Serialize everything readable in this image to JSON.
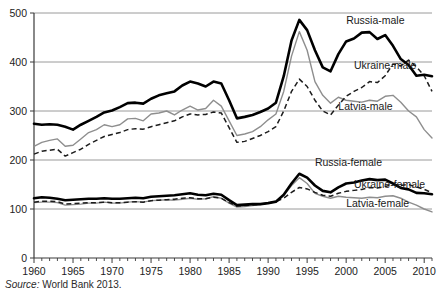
{
  "chart_data": {
    "type": "line",
    "title": "",
    "subtitle": "",
    "xlabel": "",
    "ylabel": "",
    "xlim": [
      1960,
      2011
    ],
    "ylim": [
      0,
      500
    ],
    "yticks": [
      0,
      100,
      200,
      300,
      400,
      500
    ],
    "ytick_labels": [
      "0",
      "100",
      "200",
      "300",
      "400",
      "500"
    ],
    "xticks": [
      1960,
      1965,
      1970,
      1975,
      1980,
      1985,
      1990,
      1995,
      2000,
      2005,
      2010
    ],
    "xtick_labels": [
      "1960",
      "1965",
      "1970",
      "1975",
      "1980",
      "1985",
      "1990",
      "1995",
      "2000",
      "2005",
      "2010"
    ],
    "minor_xtick_interval": 1,
    "grid": "horizontal",
    "legend_position": "inline-annotations",
    "x": [
      1960,
      1961,
      1962,
      1963,
      1964,
      1965,
      1966,
      1967,
      1968,
      1969,
      1970,
      1971,
      1972,
      1973,
      1974,
      1975,
      1976,
      1977,
      1978,
      1979,
      1980,
      1981,
      1982,
      1983,
      1984,
      1985,
      1986,
      1987,
      1988,
      1989,
      1990,
      1991,
      1992,
      1993,
      1994,
      1995,
      1996,
      1997,
      1998,
      1999,
      2000,
      2001,
      2002,
      2003,
      2004,
      2005,
      2006,
      2007,
      2008,
      2009,
      2010,
      2011
    ],
    "series": [
      {
        "name": "Russia-male",
        "style": "thick-solid-black",
        "color": "#000000",
        "label": "Russia-male",
        "values": [
          274,
          272,
          273,
          272,
          268,
          262,
          272,
          280,
          288,
          297,
          301,
          308,
          316,
          317,
          315,
          325,
          332,
          336,
          340,
          352,
          360,
          356,
          350,
          360,
          356,
          322,
          285,
          288,
          292,
          298,
          305,
          317,
          371,
          444,
          486,
          465,
          424,
          389,
          381,
          416,
          442,
          448,
          460,
          461,
          447,
          455,
          433,
          406,
          394,
          372,
          374,
          371
        ]
      },
      {
        "name": "Ukraine-male",
        "style": "dashed-black",
        "color": "#1c1c1c",
        "label": "Ukraine-male",
        "values": [
          212,
          218,
          220,
          222,
          208,
          215,
          222,
          232,
          240,
          248,
          252,
          256,
          262,
          264,
          263,
          268,
          272,
          276,
          280,
          288,
          294,
          292,
          293,
          298,
          296,
          266,
          236,
          238,
          244,
          250,
          258,
          268,
          300,
          340,
          365,
          350,
          322,
          300,
          292,
          312,
          330,
          340,
          348,
          360,
          358,
          372,
          396,
          392,
          404,
          390,
          372,
          340
        ]
      },
      {
        "name": "Latvia-male",
        "style": "thin-solid-gray",
        "color": "#8e8e8e",
        "label": "Latvia-male",
        "values": [
          228,
          236,
          240,
          243,
          228,
          230,
          243,
          256,
          262,
          272,
          268,
          272,
          284,
          285,
          280,
          294,
          296,
          300,
          292,
          302,
          310,
          302,
          305,
          322,
          310,
          280,
          250,
          253,
          258,
          268,
          282,
          294,
          340,
          412,
          462,
          424,
          360,
          332,
          316,
          328,
          322,
          320,
          318,
          322,
          320,
          330,
          332,
          318,
          300,
          288,
          262,
          245
        ]
      },
      {
        "name": "Russia-female",
        "style": "thick-solid-black",
        "color": "#000000",
        "label": "Russia-female",
        "values": [
          122,
          124,
          123,
          121,
          118,
          119,
          120,
          121,
          121,
          122,
          121,
          121,
          122,
          123,
          122,
          125,
          126,
          127,
          128,
          130,
          132,
          129,
          128,
          131,
          129,
          118,
          108,
          109,
          110,
          110,
          112,
          115,
          129,
          152,
          172,
          164,
          148,
          137,
          134,
          144,
          152,
          154,
          158,
          161,
          159,
          160,
          152,
          143,
          140,
          133,
          132,
          130
        ]
      },
      {
        "name": "Ukraine-female",
        "style": "dashed-black",
        "color": "#1c1c1c",
        "label": "Ukraine-female",
        "values": [
          114,
          116,
          116,
          115,
          110,
          111,
          112,
          113,
          113,
          114,
          113,
          113,
          114,
          115,
          114,
          117,
          118,
          119,
          120,
          122,
          123,
          121,
          121,
          124,
          122,
          113,
          106,
          107,
          108,
          110,
          112,
          115,
          122,
          134,
          144,
          141,
          134,
          128,
          126,
          132,
          136,
          138,
          140,
          144,
          143,
          146,
          150,
          148,
          150,
          145,
          140,
          133
        ]
      },
      {
        "name": "Latvia-female",
        "style": "thin-solid-gray",
        "color": "#8e8e8e",
        "label": "Latvia-female",
        "values": [
          113,
          114,
          114,
          113,
          108,
          109,
          110,
          112,
          112,
          114,
          112,
          112,
          114,
          115,
          114,
          117,
          118,
          119,
          118,
          120,
          122,
          120,
          121,
          125,
          122,
          112,
          104,
          105,
          107,
          109,
          112,
          116,
          128,
          148,
          164,
          152,
          132,
          126,
          122,
          126,
          124,
          123,
          122,
          124,
          123,
          126,
          127,
          122,
          114,
          108,
          100,
          94
        ]
      }
    ],
    "annotations": [
      {
        "text": "Russia-male",
        "x": 2000,
        "y": 478
      },
      {
        "text": "Ukraine-male",
        "x": 2001,
        "y": 386
      },
      {
        "text": "Latvia-male",
        "x": 1999,
        "y": 302
      },
      {
        "text": "Russia-female",
        "x": 1996,
        "y": 188
      },
      {
        "text": "Ukraine-female",
        "x": 2001,
        "y": 142
      },
      {
        "text": "Latvia-female",
        "x": 2000,
        "y": 105
      }
    ]
  },
  "source": {
    "prefix": "Source:",
    "text": "World Bank 2013."
  },
  "colors": {
    "gridline": "#9a9a9a",
    "axis": "#3a3a3a",
    "thick_series": "#000000",
    "dashed_series": "#1c1c1c",
    "gray_series": "#8e8e8e",
    "background": "#ffffff"
  }
}
